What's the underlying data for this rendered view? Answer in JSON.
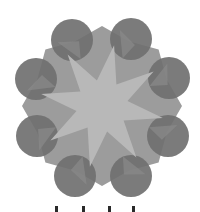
{
  "figure": {
    "colors": {
      "background": "#ffffff",
      "circle": "#707070",
      "circle_overlap": "#8a8a8a",
      "octagon": "#9c9c9c",
      "star": "#b8b8b8",
      "marks": "#2a2a2a"
    },
    "center": [
      102,
      106
    ],
    "circles": [
      {
        "cx": 72,
        "cy": 40,
        "r": 21
      },
      {
        "cx": 131,
        "cy": 39,
        "r": 21
      },
      {
        "cx": 36,
        "cy": 79,
        "r": 21
      },
      {
        "cx": 169,
        "cy": 78,
        "r": 21
      },
      {
        "cx": 37,
        "cy": 136,
        "r": 21
      },
      {
        "cx": 168,
        "cy": 136,
        "r": 21
      },
      {
        "cx": 75,
        "cy": 176,
        "r": 21
      },
      {
        "cx": 131,
        "cy": 176,
        "r": 21
      }
    ],
    "star_points": 8,
    "bottom_marks": [
      55,
      82,
      108,
      132
    ]
  }
}
